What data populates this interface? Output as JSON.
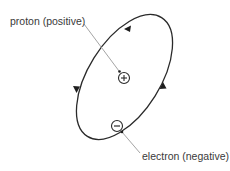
{
  "diagram": {
    "labels": {
      "proton": "proton (positive)",
      "electron": "electron (negative)"
    },
    "particles": {
      "proton": {
        "symbol": "+",
        "x": 124,
        "y": 78,
        "r": 5.5
      },
      "electron": {
        "symbol": "−",
        "x": 117,
        "y": 126,
        "r": 5.5
      }
    },
    "orbit": {
      "cx": 124.5,
      "cy": 77,
      "rx": 70,
      "ry": 36,
      "rotation": -58,
      "direction": "counter-clockwise",
      "arrow_count": 3
    },
    "colors": {
      "line": "#2a2a2a",
      "leader": "#9a9a9a",
      "text": "#3a3a3a",
      "background": "#ffffff"
    }
  }
}
